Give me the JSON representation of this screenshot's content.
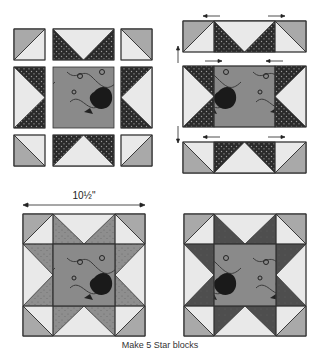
{
  "figure": {
    "caption": "Make 5 Star blocks",
    "dimension_label": "10½\"",
    "colors": {
      "light": "#e9e9e9",
      "corner_gray": "#a9a9a9",
      "dark_print": "#2a2a2a",
      "medium_print": "#8e8e8e",
      "dark_point": "#4e4e4e",
      "center_print": "#8a8a8a",
      "outline": "#333333"
    },
    "panels": [
      {
        "name": "step-1-layout",
        "description": "Block units laid out in 3x3 grid with gaps"
      },
      {
        "name": "step-2-sewn-rows",
        "description": "Units sewn into three rows with pressing arrows"
      },
      {
        "name": "step-3-finished-block-medium",
        "description": "Finished Star block with medium print points, 10½\" unfinished"
      },
      {
        "name": "step-4-finished-block-dark",
        "description": "Finished Star block with dark points"
      }
    ]
  }
}
